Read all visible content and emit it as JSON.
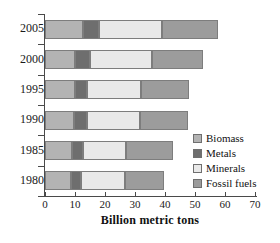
{
  "chart_data": {
    "type": "bar",
    "orientation": "horizontal",
    "stacked": true,
    "title": "",
    "xlabel": "Billion metric tons",
    "ylabel": "",
    "categories": [
      "2005",
      "2000",
      "1995",
      "1990",
      "1985",
      "1980"
    ],
    "xlim": [
      0,
      70
    ],
    "xticks": [
      0,
      10,
      20,
      30,
      40,
      50,
      60,
      70
    ],
    "xtick_labels": [
      "0",
      "10",
      "20",
      "30",
      "40",
      "50",
      "60",
      "70"
    ],
    "grid": false,
    "legend_position": "right-middle",
    "series": [
      {
        "name": "Biomass",
        "color": "#b3b3b3",
        "values": [
          12.5,
          10.0,
          10.0,
          9.5,
          9.0,
          8.5
        ]
      },
      {
        "name": "Metals",
        "color": "#6e6e6e",
        "values": [
          5.5,
          5.0,
          4.0,
          4.5,
          3.5,
          3.5
        ]
      },
      {
        "name": "Minerals",
        "color": "#e9e9e9",
        "values": [
          21.0,
          20.5,
          18.0,
          17.5,
          14.5,
          14.5
        ]
      },
      {
        "name": "Fossil fuels",
        "color": "#9c9c9c",
        "values": [
          18.5,
          17.0,
          16.0,
          16.0,
          15.5,
          13.0
        ]
      }
    ],
    "totals": [
      57.5,
      52.5,
      48.0,
      47.5,
      42.5,
      39.5
    ]
  },
  "legend": {
    "items": [
      {
        "label": "Biomass"
      },
      {
        "label": "Metals"
      },
      {
        "label": "Minerals"
      },
      {
        "label": "Fossil fuels"
      }
    ]
  }
}
